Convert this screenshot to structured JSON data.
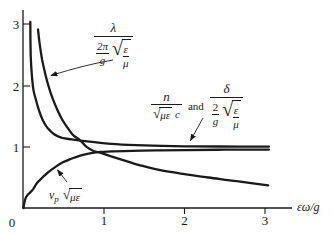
{
  "figure": {
    "bg": "#ffffff",
    "ink": "#1a1a1a"
  },
  "axes": {
    "x_label": "εω/g",
    "x_tick_labels": [
      "1",
      "2",
      "3"
    ],
    "y_tick_labels": [
      "1",
      "2",
      "3"
    ],
    "origin_label": "0"
  },
  "labels": {
    "sqrt_sign": "√",
    "and_text": "and",
    "lambda": {
      "num": "λ",
      "den_top": "2π",
      "den_bot": "g",
      "rad_top": "ε",
      "rad_bot": "μ"
    },
    "n": {
      "num": "n",
      "rad": "με",
      "suffix": "c"
    },
    "delta": {
      "num": "δ",
      "den_top": "2",
      "den_bot": "g",
      "rad_top": "ε",
      "rad_bot": "μ"
    },
    "vp": {
      "base": "v",
      "sub": "p",
      "rad": "με"
    }
  },
  "chart_data": {
    "type": "line",
    "title": "",
    "xlabel": "εω/g",
    "ylabel": "",
    "xlim": [
      0,
      3.35
    ],
    "ylim": [
      0,
      3.25
    ],
    "x_ticks": [
      0,
      1,
      2,
      3
    ],
    "y_ticks": [
      1,
      2,
      3
    ],
    "grid": false,
    "legend_position": "inline-arrows",
    "series": [
      {
        "name": "n/(√(με)·c) and δ/((2/g)·√(ε/μ))",
        "x": [
          0.085,
          0.086,
          0.09,
          0.098,
          0.11,
          0.125,
          0.155,
          0.19,
          0.24,
          0.3,
          0.38,
          0.48,
          0.6,
          0.73,
          0.88,
          1.05,
          1.3,
          1.6,
          2.0,
          2.45,
          3.05
        ],
        "y": [
          3.05,
          2.78,
          2.5,
          2.28,
          2.08,
          1.92,
          1.77,
          1.61,
          1.44,
          1.31,
          1.21,
          1.15,
          1.125,
          1.1,
          1.078,
          1.055,
          1.035,
          1.022,
          1.012,
          1.008,
          1.007
        ]
      },
      {
        "name": "λ/((2π/g)·√(ε/μ))",
        "x": [
          0.18,
          0.2,
          0.23,
          0.27,
          0.31,
          0.36,
          0.42,
          0.48,
          0.55,
          0.62,
          0.7,
          0.78,
          0.87,
          0.97,
          1.08,
          1.25,
          1.45,
          1.7,
          2.0,
          2.3,
          2.65,
          3.04
        ],
        "y": [
          2.93,
          2.7,
          2.44,
          2.2,
          2.0,
          1.8,
          1.61,
          1.45,
          1.31,
          1.19,
          1.115,
          1.005,
          0.935,
          0.9,
          0.85,
          0.78,
          0.7,
          0.62,
          0.555,
          0.5,
          0.44,
          0.37
        ]
      },
      {
        "name": "vp·√(με)",
        "x": [
          0,
          0.012,
          0.03,
          0.055,
          0.08,
          0.12,
          0.168,
          0.22,
          0.267,
          0.34,
          0.416,
          0.49,
          0.578,
          0.66,
          0.739,
          0.84,
          0.95,
          1.1,
          1.35,
          1.65,
          2.0,
          2.5,
          3.05
        ],
        "y": [
          0,
          0.1,
          0.17,
          0.22,
          0.25,
          0.31,
          0.41,
          0.48,
          0.54,
          0.62,
          0.69,
          0.75,
          0.8,
          0.84,
          0.87,
          0.9,
          0.92,
          0.928,
          0.938,
          0.944,
          0.95,
          0.955,
          0.958
        ]
      }
    ]
  }
}
